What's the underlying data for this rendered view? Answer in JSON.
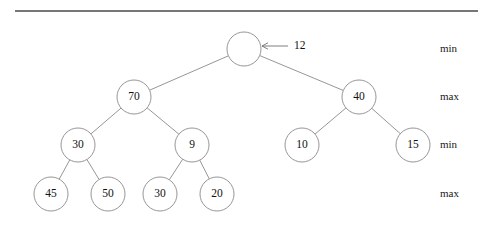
{
  "figure": {
    "type": "binary-tree-diagram",
    "width": 495,
    "height": 235,
    "background_color": "#ffffff",
    "stroke_color": "#8a8a8a",
    "text_color": "#111111"
  },
  "divider": {
    "name": "top-horizontal-rule",
    "x1": 15,
    "x2": 478,
    "y": 11,
    "color": "#4a4a4a"
  },
  "nodes": [
    {
      "id": "root",
      "label": "",
      "cx": 244,
      "cy": 49,
      "r": 17
    },
    {
      "id": "n70",
      "label": "70",
      "cx": 134,
      "cy": 97,
      "r": 17
    },
    {
      "id": "n40",
      "label": "40",
      "cx": 359,
      "cy": 97,
      "r": 17
    },
    {
      "id": "n30a",
      "label": "30",
      "cx": 78,
      "cy": 145,
      "r": 17
    },
    {
      "id": "n9",
      "label": "9",
      "cx": 192,
      "cy": 145,
      "r": 17
    },
    {
      "id": "n10",
      "label": "10",
      "cx": 302,
      "cy": 145,
      "r": 17
    },
    {
      "id": "n15",
      "label": "15",
      "cx": 413,
      "cy": 145,
      "r": 17
    },
    {
      "id": "n45",
      "label": "45",
      "cx": 51,
      "cy": 194,
      "r": 17
    },
    {
      "id": "n50",
      "label": "50",
      "cx": 108,
      "cy": 194,
      "r": 17
    },
    {
      "id": "n30b",
      "label": "30",
      "cx": 160,
      "cy": 194,
      "r": 17
    },
    {
      "id": "n20",
      "label": "20",
      "cx": 217,
      "cy": 194,
      "r": 17
    }
  ],
  "edges": [
    {
      "from": "root",
      "to": "n70"
    },
    {
      "from": "root",
      "to": "n40"
    },
    {
      "from": "n70",
      "to": "n30a"
    },
    {
      "from": "n70",
      "to": "n9"
    },
    {
      "from": "n40",
      "to": "n10"
    },
    {
      "from": "n40",
      "to": "n15"
    },
    {
      "from": "n30a",
      "to": "n45"
    },
    {
      "from": "n30a",
      "to": "n50"
    },
    {
      "from": "n9",
      "to": "n30b"
    },
    {
      "from": "n9",
      "to": "n20"
    }
  ],
  "annotation": {
    "name": "insert-value-pointer",
    "value": "12",
    "label_x": 294,
    "label_y": 46,
    "arrow_tail_x": 288,
    "arrow_tip_x": 262,
    "arrow_y": 46
  },
  "level_labels": [
    {
      "text": "min",
      "x": 440,
      "y": 49
    },
    {
      "text": "max",
      "x": 440,
      "y": 97
    },
    {
      "text": "min",
      "x": 440,
      "y": 145
    },
    {
      "text": "max",
      "x": 440,
      "y": 194
    }
  ]
}
